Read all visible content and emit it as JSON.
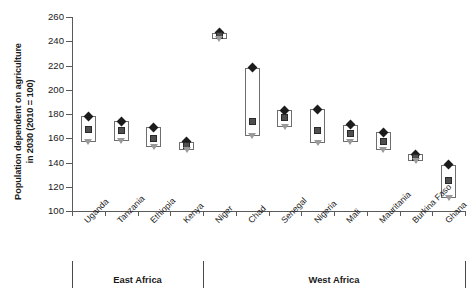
{
  "chart_data": {
    "type": "bar",
    "title": "",
    "xlabel": "",
    "ylabel": "Population dependent on agriculture in 2030 (2010 = 100)",
    "ylabel_lines": [
      "Population dependent on agriculture",
      "in 2030 (2010 = 100)"
    ],
    "ylim": [
      100,
      260
    ],
    "yticks": [
      100,
      120,
      140,
      160,
      180,
      200,
      220,
      240,
      260
    ],
    "grid": false,
    "legend": "none",
    "categories": [
      "Uganda",
      "Tanzania",
      "Ethiopia",
      "Kenya",
      "Niger",
      "Chad",
      "Senegal",
      "Nigeria",
      "Mali",
      "Mauritania",
      "Burkina Faso",
      "Ghana"
    ],
    "groups": [
      {
        "label": "East Africa",
        "categories": [
          "Uganda",
          "Tanzania",
          "Ethiopia",
          "Kenya"
        ]
      },
      {
        "label": "West Africa",
        "categories": [
          "Niger",
          "Chad",
          "Senegal",
          "Nigeria",
          "Mali",
          "Mauritania",
          "Burkina Faso",
          "Ghana"
        ]
      }
    ],
    "series": [
      {
        "name": "maximum",
        "marker": "diamond",
        "values": [
          178,
          174,
          169,
          157,
          247,
          218,
          183,
          184,
          171,
          165,
          147,
          138
        ]
      },
      {
        "name": "median",
        "marker": "square",
        "values": [
          167,
          166,
          160,
          154,
          245,
          174,
          177,
          166,
          164,
          157,
          144,
          125
        ]
      },
      {
        "name": "minimum",
        "marker": "triangle",
        "values": [
          157,
          158,
          153,
          150,
          242,
          162,
          169,
          156,
          157,
          150,
          141,
          111
        ]
      }
    ],
    "boxes": [
      {
        "category": "Uganda",
        "top": 178,
        "bottom": 157
      },
      {
        "category": "Tanzania",
        "top": 174,
        "bottom": 158
      },
      {
        "category": "Ethiopia",
        "top": 169,
        "bottom": 153
      },
      {
        "category": "Kenya",
        "top": 157,
        "bottom": 150
      },
      {
        "category": "Niger",
        "top": 247,
        "bottom": 242
      },
      {
        "category": "Chad",
        "top": 218,
        "bottom": 162
      },
      {
        "category": "Senegal",
        "top": 183,
        "bottom": 169
      },
      {
        "category": "Nigeria",
        "top": 184,
        "bottom": 156
      },
      {
        "category": "Mali",
        "top": 171,
        "bottom": 157
      },
      {
        "category": "Mauritania",
        "top": 165,
        "bottom": 150
      },
      {
        "category": "Burkina Faso",
        "top": 147,
        "bottom": 141
      },
      {
        "category": "Ghana",
        "top": 138,
        "bottom": 111
      }
    ],
    "colors": {
      "axis": "#5a5a5a",
      "box_border": "#6e6e6e",
      "max_marker": "#1c1c1c",
      "median_marker": "#4f4f4f",
      "min_marker": "#9a9a9a",
      "background": "#ffffff",
      "text": "#1a1a1a"
    }
  }
}
